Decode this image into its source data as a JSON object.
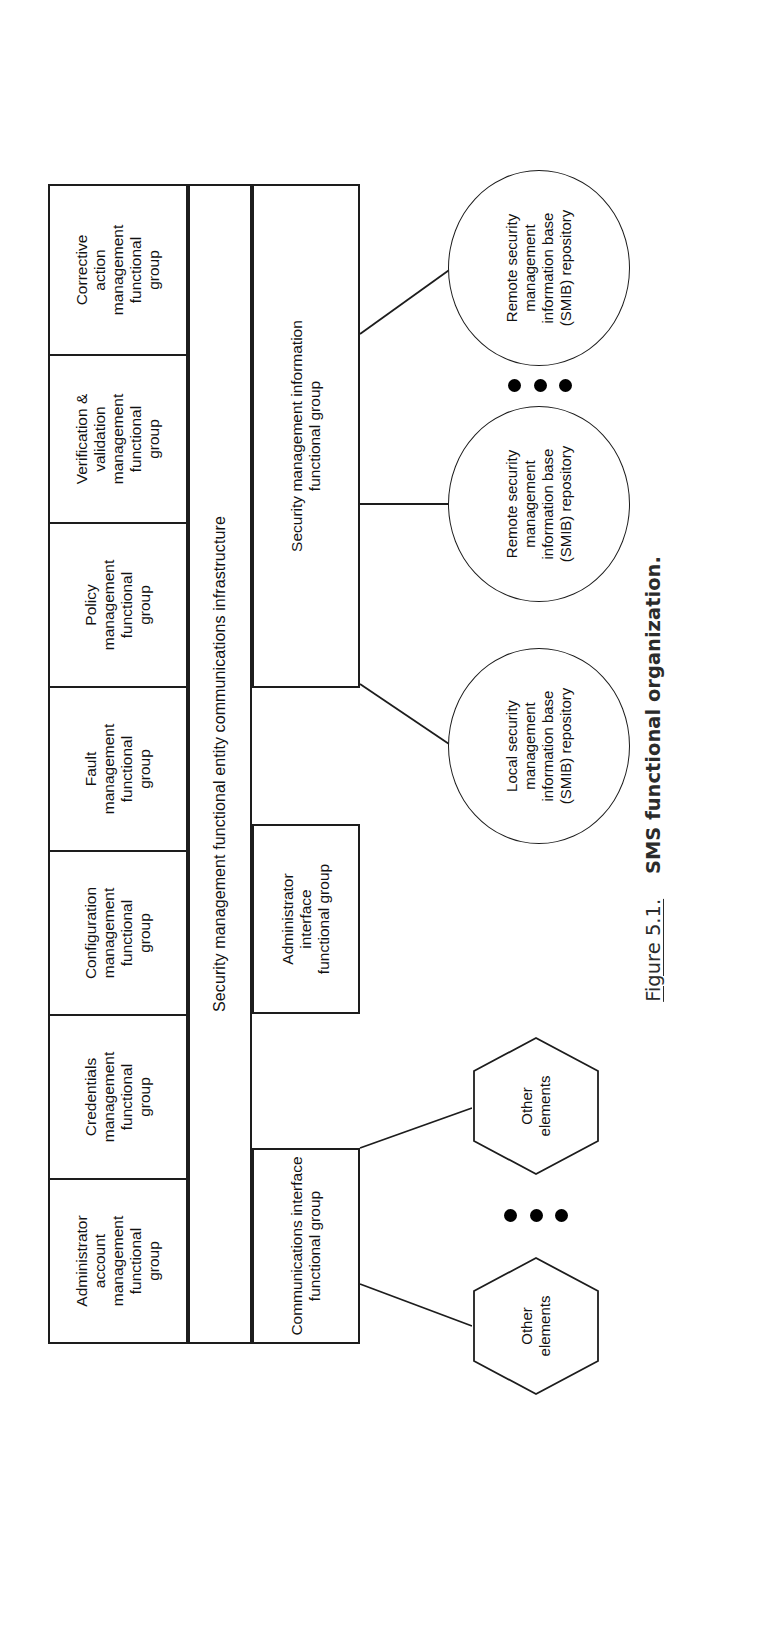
{
  "figure": {
    "number": "Figure 5.1.",
    "title": "SMS functional organization."
  },
  "diagram": {
    "middle_bar": "Security management functional entity communications infrastructure",
    "top_groups": [
      {
        "label": "Administrator\naccount\nmanagement\nfunctional\ngroup"
      },
      {
        "label": "Credentials\nmanagement\nfunctional\ngroup"
      },
      {
        "label": "Configuration\nmanagement\nfunctional\ngroup"
      },
      {
        "label": "Fault\nmanagement\nfunctional\ngroup"
      },
      {
        "label": "Policy\nmanagement\nfunctional\ngroup"
      },
      {
        "label": "Verification &\nvalidation\nmanagement\nfunctional\ngroup"
      },
      {
        "label": "Corrective\naction\nmanagement\nfunctional\ngroup"
      }
    ],
    "bottom_groups": [
      {
        "label": "Communications interface\nfunctional group"
      },
      {
        "label": "Administrator\ninterface\nfunctional group"
      },
      {
        "label": "Security management information\nfunctional group"
      }
    ],
    "repositories": [
      {
        "label": "Local security\nmanagement\ninformation base\n(SMIB) repository"
      },
      {
        "label": "Remote security\nmanagement\ninformation base\n(SMIB) repository"
      },
      {
        "label": "Remote security\nmanagement\ninformation base\n(SMIB) repository"
      }
    ],
    "elements": [
      {
        "label": "Other\nelements"
      },
      {
        "label": "Other\nelements"
      }
    ],
    "ellipsis_glyph": "•••",
    "stroke_color": "#1d1d1d",
    "fill_color": "#ffffff"
  }
}
